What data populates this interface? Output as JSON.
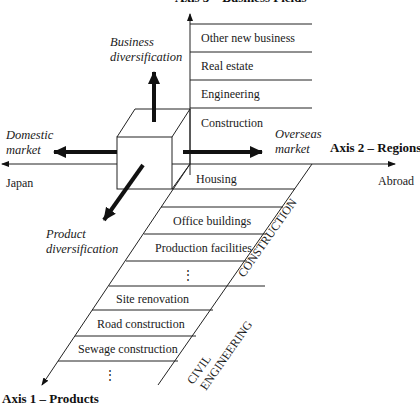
{
  "axes": {
    "axis1": {
      "label": "Axis 1 – Products"
    },
    "axis2": {
      "label": "Axis 2 – Regions",
      "left_end": "Japan",
      "right_end": "Abroad"
    },
    "axis3": {
      "label": "Axis 3 – Business Fields"
    }
  },
  "directions": {
    "up": {
      "line1": "Business",
      "line2": "diversification"
    },
    "left": {
      "line1": "Domestic",
      "line2": "market"
    },
    "right": {
      "line1": "Overseas",
      "line2": "market"
    },
    "down": {
      "line1": "Product",
      "line2": "diversification"
    }
  },
  "business_fields": [
    {
      "label": "Other new business"
    },
    {
      "label": "Real estate"
    },
    {
      "label": "Engineering"
    },
    {
      "label": "Construction"
    }
  ],
  "products": {
    "construction_group": {
      "label": "CONSTRUCTION",
      "items": [
        {
          "label": "Housing"
        },
        {
          "label": "Office buildings"
        },
        {
          "label": "Production facilities"
        },
        {
          "label": "⋮"
        }
      ]
    },
    "civil_group": {
      "label_line1": "CIVIL",
      "label_line2": "ENGINEERING",
      "items": [
        {
          "label": "Site renovation"
        },
        {
          "label": "Road construction"
        },
        {
          "label": "Sewage construction"
        },
        {
          "label": "⋮"
        }
      ]
    }
  }
}
